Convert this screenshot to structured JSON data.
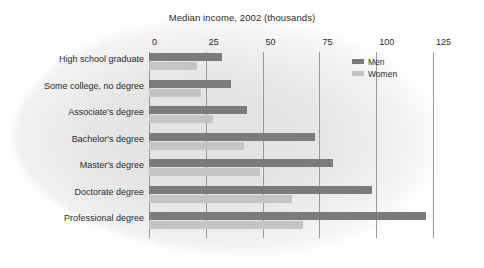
{
  "chart_data": {
    "type": "bar",
    "orientation": "horizontal",
    "title": "Median income, 2002 (thousands)",
    "xlabel": "",
    "ylabel": "",
    "xlim": [
      0,
      125
    ],
    "xticks": [
      0,
      25,
      50,
      75,
      100,
      125
    ],
    "xtick_labels": [
      "0",
      "25",
      "50",
      "75",
      "100",
      "125"
    ],
    "grid": true,
    "legend_position": "top-right",
    "categories": [
      "High school graduate",
      "Some college, no degree",
      "Associate's degree",
      "Bachelor's degree",
      "Master's degree",
      "Doctorate degree",
      "Professional degree"
    ],
    "series": [
      {
        "name": "Men",
        "color": "#7b7b7b",
        "values": [
          32,
          36,
          43,
          73,
          81,
          98,
          122
        ]
      },
      {
        "name": "Women",
        "color": "#c4c4c4",
        "values": [
          21,
          23,
          28,
          42,
          49,
          63,
          68
        ]
      }
    ]
  },
  "legend": {
    "entries": [
      {
        "label": "Men",
        "swatch": "men"
      },
      {
        "label": "Women",
        "swatch": "women"
      }
    ]
  }
}
